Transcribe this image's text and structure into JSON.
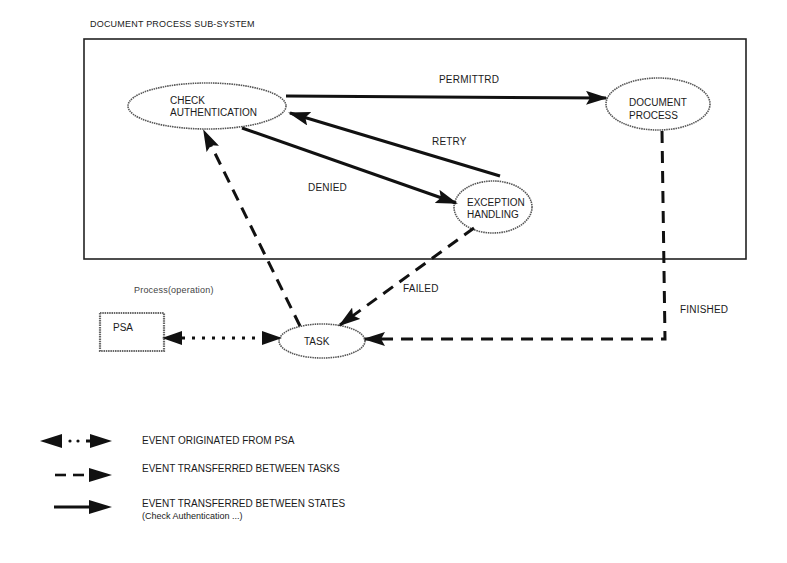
{
  "diagram": {
    "container_title": "DOCUMENT PROCESS SUB-SYSTEM",
    "nodes": {
      "check_auth": {
        "line1": "CHECK",
        "line2": "AUTHENTICATION"
      },
      "doc_process": {
        "line1": "DOCUMENT",
        "line2": "PROCESS"
      },
      "exception": {
        "line1": "EXCEPTION",
        "line2": "HANDLING"
      },
      "task": {
        "label": "TASK"
      },
      "psa": {
        "label": "PSA"
      }
    },
    "edges": {
      "permitted": "PERMITTRD",
      "retry": "RETRY",
      "denied": "DENIED",
      "failed": "FAILED",
      "finished": "FINISHED"
    },
    "process_label": "Process(operation)",
    "legend": [
      {
        "style": "dotted-bidirectional",
        "text": "EVENT ORIGINATED FROM PSA"
      },
      {
        "style": "dashed",
        "text": "EVENT TRANSFERRED BETWEEN TASKS"
      },
      {
        "style": "solid",
        "text": "EVENT TRANSFERRED BETWEEN STATES",
        "subtext": "(Check Authentication ...)"
      }
    ]
  }
}
